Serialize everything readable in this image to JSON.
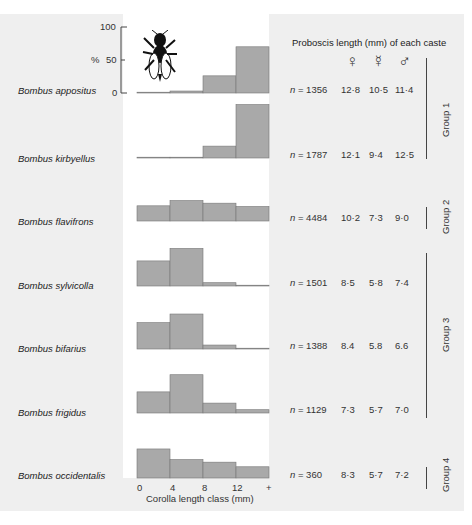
{
  "chart_data": {
    "type": "bar",
    "title": "Proboscis length (mm) of each caste",
    "xlabel": "Corolla length class (mm)",
    "ylabel": "%",
    "ylim": [
      0,
      100
    ],
    "yticks": [
      "0",
      "50",
      "100"
    ],
    "categories": [
      "0-4",
      "4-8",
      "8-12",
      "12+"
    ],
    "xtick_labels": [
      "0",
      "4",
      "8",
      "12",
      "+"
    ],
    "caste_symbols": [
      "♀",
      "☿",
      "♂"
    ],
    "caste_names": [
      "queen",
      "worker",
      "male"
    ],
    "series": [
      {
        "name": "Bombus appositus",
        "values": [
          1,
          3,
          26,
          70
        ],
        "n": "n = 1356",
        "proboscis": [
          "12·8",
          "10·5",
          "11·4"
        ],
        "group": "Group 1"
      },
      {
        "name": "Bombus kirbyellus",
        "values": [
          0,
          1,
          18,
          81
        ],
        "n": "n = 1787",
        "proboscis": [
          "12·1",
          "9·4",
          "12·5"
        ],
        "group": "Group 1"
      },
      {
        "name": "Bombus flavifrons",
        "values": [
          23,
          31,
          27,
          22
        ],
        "n": "n = 4484",
        "proboscis": [
          "10·2",
          "7·3",
          "9·0"
        ],
        "group": "Group 2"
      },
      {
        "name": "Bombus sylvicolla",
        "values": [
          38,
          57,
          5,
          0
        ],
        "n": "n = 1501",
        "proboscis": [
          "8·5",
          "5·8",
          "7·4"
        ],
        "group": "Group 3"
      },
      {
        "name": "Bombus bifarius",
        "values": [
          40,
          53,
          6,
          0
        ],
        "n": "n = 1388",
        "proboscis": [
          "8.4",
          "5.8",
          "6.6"
        ],
        "group": "Group 3"
      },
      {
        "name": "Bombus frigidus",
        "values": [
          32,
          58,
          15,
          5
        ],
        "n": "n = 1129",
        "proboscis": [
          "7·3",
          "5·7",
          "7·0"
        ],
        "group": "Group 3"
      },
      {
        "name": "Bombus occidentalis",
        "values": [
          44,
          28,
          24,
          17
        ],
        "n": "n = 360",
        "proboscis": [
          "8·3",
          "5·7",
          "7·2"
        ],
        "group": "Group 4"
      }
    ],
    "groups": [
      "Group 1",
      "Group 2",
      "Group 3",
      "Group 4"
    ],
    "bar_color": "#a9a9a9",
    "grid": false,
    "legend": "none"
  }
}
